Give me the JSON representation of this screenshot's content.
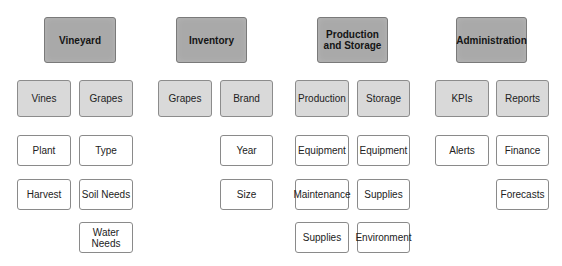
{
  "diagram": {
    "type": "hierarchy",
    "colors": {
      "level1_fill": "#a9a9a9",
      "level2_fill": "#d9d9d9",
      "level3_fill": "#ffffff",
      "border": "#8a8a8a",
      "text": "#222222"
    },
    "nodes": [
      {
        "id": "vineyard",
        "label": "Vineyard",
        "level": 1,
        "x": 44,
        "y": 17,
        "w": 72,
        "h": 46
      },
      {
        "id": "inventory",
        "label": "Inventory",
        "level": 1,
        "x": 176,
        "y": 17,
        "w": 71,
        "h": 46
      },
      {
        "id": "production-and-storage",
        "label": "Production\nand Storage",
        "level": 1,
        "x": 317,
        "y": 17,
        "w": 71,
        "h": 46
      },
      {
        "id": "administration",
        "label": "Administration",
        "level": 1,
        "x": 456,
        "y": 17,
        "w": 71,
        "h": 46
      },
      {
        "id": "vines",
        "label": "Vines",
        "level": 2,
        "parent": "vineyard",
        "x": 17,
        "y": 80,
        "w": 54,
        "h": 37
      },
      {
        "id": "vineyard-grapes",
        "label": "Grapes",
        "level": 2,
        "parent": "vineyard",
        "x": 79,
        "y": 80,
        "w": 54,
        "h": 37
      },
      {
        "id": "inventory-grapes",
        "label": "Grapes",
        "level": 2,
        "parent": "inventory",
        "x": 158,
        "y": 80,
        "w": 54,
        "h": 37
      },
      {
        "id": "brand",
        "label": "Brand",
        "level": 2,
        "parent": "inventory",
        "x": 220,
        "y": 80,
        "w": 53,
        "h": 37
      },
      {
        "id": "production",
        "label": "Production",
        "level": 2,
        "parent": "production-and-storage",
        "x": 295,
        "y": 80,
        "w": 54,
        "h": 37
      },
      {
        "id": "storage",
        "label": "Storage",
        "level": 2,
        "parent": "production-and-storage",
        "x": 357,
        "y": 80,
        "w": 53,
        "h": 37
      },
      {
        "id": "kpis",
        "label": "KPIs",
        "level": 2,
        "parent": "administration",
        "x": 435,
        "y": 80,
        "w": 54,
        "h": 37
      },
      {
        "id": "reports",
        "label": "Reports",
        "level": 2,
        "parent": "administration",
        "x": 496,
        "y": 80,
        "w": 53,
        "h": 37
      },
      {
        "id": "plant",
        "label": "Plant",
        "level": 3,
        "parent": "vines",
        "x": 17,
        "y": 135,
        "w": 54,
        "h": 31
      },
      {
        "id": "harvest",
        "label": "Harvest",
        "level": 3,
        "parent": "vines",
        "x": 17,
        "y": 179,
        "w": 54,
        "h": 31
      },
      {
        "id": "type",
        "label": "Type",
        "level": 3,
        "parent": "vineyard-grapes",
        "x": 79,
        "y": 135,
        "w": 54,
        "h": 31
      },
      {
        "id": "soil-needs",
        "label": "Soil Needs",
        "level": 3,
        "parent": "vineyard-grapes",
        "x": 79,
        "y": 179,
        "w": 54,
        "h": 31
      },
      {
        "id": "water-needs",
        "label": "Water\nNeeds",
        "level": 3,
        "parent": "vineyard-grapes",
        "x": 79,
        "y": 222,
        "w": 54,
        "h": 31
      },
      {
        "id": "year",
        "label": "Year",
        "level": 3,
        "parent": "brand",
        "x": 220,
        "y": 135,
        "w": 53,
        "h": 31
      },
      {
        "id": "size",
        "label": "Size",
        "level": 3,
        "parent": "brand",
        "x": 220,
        "y": 179,
        "w": 53,
        "h": 31
      },
      {
        "id": "production-equipment",
        "label": "Equipment",
        "level": 3,
        "parent": "production",
        "x": 295,
        "y": 135,
        "w": 54,
        "h": 31
      },
      {
        "id": "maintenance",
        "label": "Maintenance",
        "level": 3,
        "parent": "production",
        "x": 295,
        "y": 179,
        "w": 54,
        "h": 31
      },
      {
        "id": "production-supplies",
        "label": "Supplies",
        "level": 3,
        "parent": "production",
        "x": 295,
        "y": 222,
        "w": 54,
        "h": 31
      },
      {
        "id": "storage-equipment",
        "label": "Equipment",
        "level": 3,
        "parent": "storage",
        "x": 357,
        "y": 135,
        "w": 53,
        "h": 31
      },
      {
        "id": "storage-supplies",
        "label": "Supplies",
        "level": 3,
        "parent": "storage",
        "x": 357,
        "y": 179,
        "w": 53,
        "h": 31
      },
      {
        "id": "environment",
        "label": "Environment",
        "level": 3,
        "parent": "storage",
        "x": 357,
        "y": 222,
        "w": 53,
        "h": 31
      },
      {
        "id": "alerts",
        "label": "Alerts",
        "level": 3,
        "parent": "kpis",
        "x": 435,
        "y": 135,
        "w": 54,
        "h": 31
      },
      {
        "id": "finance",
        "label": "Finance",
        "level": 3,
        "parent": "reports",
        "x": 496,
        "y": 135,
        "w": 53,
        "h": 31
      },
      {
        "id": "forecasts",
        "label": "Forecasts",
        "level": 3,
        "parent": "reports",
        "x": 496,
        "y": 179,
        "w": 53,
        "h": 31
      }
    ]
  }
}
